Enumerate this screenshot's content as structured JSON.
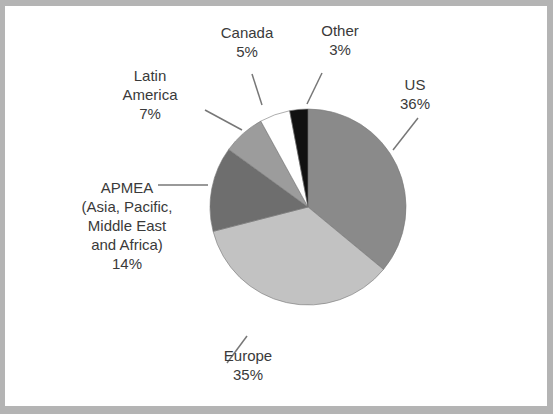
{
  "chart_data": {
    "type": "pie",
    "title": "",
    "categories": [
      "US",
      "Europe",
      "APMEA (Asia, Pacific, Middle East and Africa)",
      "Latin America",
      "Canada",
      "Other"
    ],
    "values": [
      36,
      35,
      14,
      7,
      5,
      3
    ],
    "unit": "%",
    "colors": [
      "#8a8a8a",
      "#c2c2c2",
      "#6e6e6e",
      "#9c9c9c",
      "#ffffff",
      "#111111"
    ],
    "legend": "none (leader-line labels)",
    "start_angle_deg": 0,
    "direction": "clockwise"
  },
  "labels": {
    "us": {
      "name": "US",
      "pct": "36%"
    },
    "europe": {
      "name": "Europe",
      "pct": "35%"
    },
    "apmea": {
      "line1": "APMEA",
      "line2": "(Asia, Pacific,",
      "line3": "Middle East",
      "line4": "and Africa)",
      "pct": "14%"
    },
    "latin": {
      "line1": "Latin",
      "line2": "America",
      "pct": "7%"
    },
    "canada": {
      "name": "Canada",
      "pct": "5%"
    },
    "other": {
      "name": "Other",
      "pct": "3%"
    }
  }
}
